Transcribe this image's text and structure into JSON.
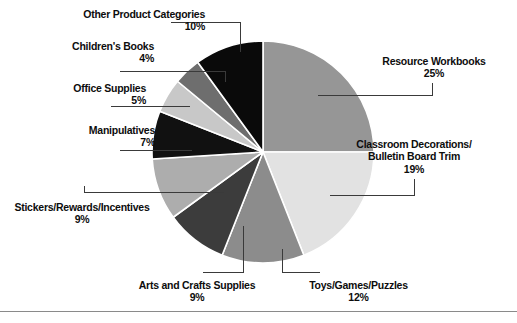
{
  "figure": {
    "background": "#ffffff",
    "rule_color": "#8a8a8a"
  },
  "chart_data": {
    "type": "pie",
    "title": "",
    "subtitle": "",
    "xlabel": "",
    "ylabel": "",
    "legend_position": "none",
    "grid": false,
    "start_angle_deg": 0,
    "direction": "clockwise",
    "units": "percent",
    "total": 100,
    "categories": [
      "Resource Workbooks",
      "Classroom Decorations/Bulletin Board Trim",
      "Toys/Games/Puzzles",
      "Arts and Crafts Supplies",
      "Stickers/Rewards/Incentives",
      "Manipulatives",
      "Office Supplies",
      "Children's Books",
      "Other Product Categories"
    ],
    "values": [
      25,
      19,
      12,
      9,
      9,
      7,
      5,
      4,
      10
    ],
    "value_labels": [
      "25%",
      "19%",
      "12%",
      "9%",
      "9%",
      "7%",
      "5%",
      "4%",
      "10%"
    ],
    "colors": [
      "#969696",
      "#e2e2e2",
      "#8c8c8c",
      "#3c3c3c",
      "#adadad",
      "#111111",
      "#c8c8c8",
      "#6e6e6e",
      "#0a0a0a"
    ],
    "slice_edge_color": "#ffffff",
    "slices": [
      {
        "label": "Resource Workbooks",
        "label_line2": "",
        "value": 25,
        "value_label": "25%",
        "color": "#969696"
      },
      {
        "label": "Classroom Decorations/",
        "label_line2": "Bulletin Board Trim",
        "value": 19,
        "value_label": "19%",
        "color": "#e2e2e2"
      },
      {
        "label": "Toys/Games/Puzzles",
        "label_line2": "",
        "value": 12,
        "value_label": "12%",
        "color": "#8c8c8c"
      },
      {
        "label": "Arts and Crafts Supplies",
        "label_line2": "",
        "value": 9,
        "value_label": "9%",
        "color": "#3c3c3c"
      },
      {
        "label": "Stickers/Rewards/Incentives",
        "label_line2": "",
        "value": 9,
        "value_label": "9%",
        "color": "#adadad"
      },
      {
        "label": "Manipulatives",
        "label_line2": "",
        "value": 7,
        "value_label": "7%",
        "color": "#111111"
      },
      {
        "label": "Office Supplies",
        "label_line2": "",
        "value": 5,
        "value_label": "5%",
        "color": "#c8c8c8"
      },
      {
        "label": "Children's Books",
        "label_line2": "",
        "value": 4,
        "value_label": "4%",
        "color": "#6e6e6e"
      },
      {
        "label": "Other Product Categories",
        "label_line2": "",
        "value": 10,
        "value_label": "10%",
        "color": "#0a0a0a"
      }
    ]
  },
  "labels": {
    "other_product_categories": {
      "name": "Other Product Categories",
      "pct": "10%"
    },
    "childrens_books": {
      "name": "Children's Books",
      "pct": "4%"
    },
    "office_supplies": {
      "name": "Office Supplies",
      "pct": "5%"
    },
    "manipulatives": {
      "name": "Manipulatives",
      "pct": "7%"
    },
    "stickers_rewards_incentives": {
      "name": "Stickers/Rewards/Incentives",
      "pct": "9%"
    },
    "arts_and_crafts_supplies": {
      "name": "Arts and Crafts Supplies",
      "pct": "9%"
    },
    "toys_games_puzzles": {
      "name": "Toys/Games/Puzzles",
      "pct": "12%"
    },
    "classroom_decorations": {
      "name": "Classroom Decorations/",
      "name2": "Bulletin Board Trim",
      "pct": "19%"
    },
    "resource_workbooks": {
      "name": "Resource Workbooks",
      "pct": "25%"
    }
  }
}
